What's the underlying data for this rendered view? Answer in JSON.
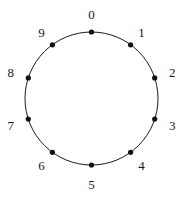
{
  "figure": {
    "kind": "cycle-graph-diagram",
    "background_color": "#ffffff",
    "stroke_color": "#1a1a1a",
    "vertex_color": "#111111",
    "label_color": "#1a1a1a",
    "circle": {
      "center_x": 91.5,
      "center_y": 98.5,
      "radius": 66.5,
      "stroke_width": 1
    },
    "vertex_radius": 2.6,
    "label_radius": 85,
    "node_count": 10,
    "nodes": [
      {
        "label": "0",
        "angle_deg": -90,
        "x": 91.5,
        "y": 32.0,
        "label_x": 91.5,
        "label_y": 13.5
      },
      {
        "label": "1",
        "angle_deg": -54,
        "x": 130.6,
        "y": 44.8,
        "label_x": 141.5,
        "label_y": 31.5
      },
      {
        "label": "2",
        "angle_deg": -18,
        "x": 154.7,
        "y": 77.9,
        "label_x": 172.3,
        "label_y": 72.2
      },
      {
        "label": "3",
        "angle_deg": 18,
        "x": 154.7,
        "y": 119.1,
        "label_x": 172.3,
        "label_y": 124.8
      },
      {
        "label": "4",
        "angle_deg": 54,
        "x": 130.6,
        "y": 152.3,
        "label_x": 141.5,
        "label_y": 165.3
      },
      {
        "label": "5",
        "angle_deg": 90,
        "x": 91.5,
        "y": 165.0,
        "label_x": 91.5,
        "label_y": 183.5
      },
      {
        "label": "6",
        "angle_deg": 126,
        "x": 52.4,
        "y": 152.3,
        "label_x": 41.5,
        "label_y": 165.3
      },
      {
        "label": "7",
        "angle_deg": 162,
        "x": 28.3,
        "y": 119.1,
        "label_x": 10.7,
        "label_y": 124.8
      },
      {
        "label": "8",
        "angle_deg": 198,
        "x": 28.3,
        "y": 77.9,
        "label_x": 10.7,
        "label_y": 72.2
      },
      {
        "label": "9",
        "angle_deg": 234,
        "x": 52.4,
        "y": 44.8,
        "label_x": 41.5,
        "label_y": 31.5
      }
    ]
  }
}
